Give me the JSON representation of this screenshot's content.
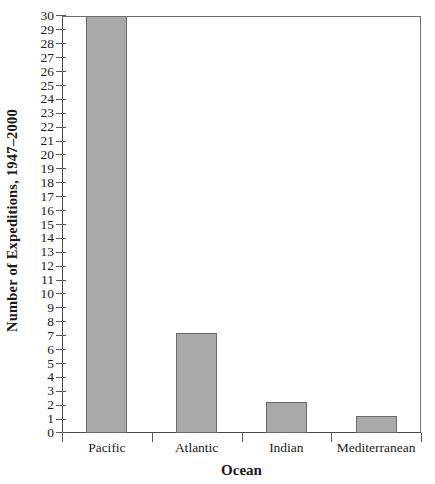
{
  "chart_data": {
    "type": "bar",
    "title": "",
    "xlabel": "Ocean",
    "ylabel": "Number of Expeditions, 1947–2000",
    "categories": [
      "Pacific",
      "Atlantic",
      "Indian",
      "Mediterranean"
    ],
    "values": [
      30,
      7.2,
      2.2,
      1.2
    ],
    "ylim": [
      0,
      30
    ],
    "ytick_step": 1,
    "ytick_labels": [
      "0",
      "1",
      "2",
      "3",
      "4",
      "5",
      "6",
      "7",
      "8",
      "9",
      "10",
      "11",
      "12",
      "13",
      "14",
      "15",
      "16",
      "17",
      "18",
      "19",
      "20",
      "21",
      "22",
      "23",
      "24",
      "25",
      "26",
      "27",
      "28",
      "29",
      "30"
    ],
    "grid": false,
    "legend": null,
    "bar_fill_color": "#a9a9a9",
    "bar_edge_color": "#6b6b6b",
    "axis_color": "#4a4a4a",
    "frame": "full-box"
  },
  "axes": {
    "y_title": "Number of Expeditions, 1947–2000",
    "x_title": "Ocean"
  }
}
